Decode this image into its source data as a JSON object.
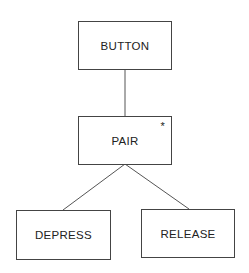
{
  "diagram": {
    "nodes": [
      {
        "id": "button",
        "label": "BUTTON"
      },
      {
        "id": "pair",
        "label": "PAIR",
        "marker": "*"
      },
      {
        "id": "depress",
        "label": "DEPRESS"
      },
      {
        "id": "release",
        "label": "RELEASE"
      }
    ],
    "edges": [
      {
        "from": "button",
        "to": "pair"
      },
      {
        "from": "pair",
        "to": "depress"
      },
      {
        "from": "pair",
        "to": "release"
      }
    ]
  }
}
